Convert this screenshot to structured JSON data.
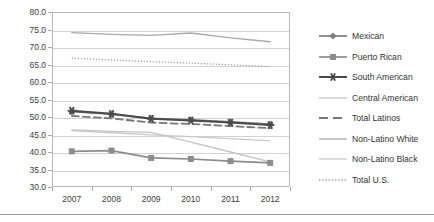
{
  "chart_data": {
    "type": "line",
    "title": "",
    "subtitle": "",
    "xlabel": "",
    "ylabel": "",
    "categories": [
      "2007",
      "2008",
      "2009",
      "2010",
      "2011",
      "2012"
    ],
    "x": [
      2007,
      2008,
      2009,
      2010,
      2011,
      2012
    ],
    "ylim": [
      30.0,
      80.0
    ],
    "ytick_step": 5.0,
    "ytick_labels": [
      "80.0",
      "75.0",
      "70.0",
      "65.0",
      "60.0",
      "55.0",
      "50.0",
      "45.0",
      "40.0",
      "35.0",
      "30.0"
    ],
    "ytick_values": [
      80.0,
      75.0,
      70.0,
      65.0,
      60.0,
      55.0,
      50.0,
      45.0,
      40.0,
      35.0,
      30.0
    ],
    "xtick_labels": [
      "2007",
      "2008",
      "2009",
      "2010",
      "2011",
      "2012"
    ],
    "grid": "horizontal",
    "legend_position": "right",
    "series": [
      {
        "name": "Mexican",
        "marker": "diamond",
        "linestyle": "solid",
        "color": "#808080",
        "values": [
          51.5,
          50.8,
          49.6,
          49.2,
          48.6,
          48.0
        ]
      },
      {
        "name": "Puerto Rican",
        "marker": "square",
        "linestyle": "solid",
        "color": "#8c8c8c",
        "values": [
          40.2,
          40.4,
          38.3,
          38.0,
          37.4,
          36.9
        ]
      },
      {
        "name": "South American",
        "marker": "star",
        "linestyle": "solid",
        "color": "#4a4a4a",
        "values": [
          51.8,
          50.9,
          49.5,
          49.0,
          48.4,
          47.7
        ]
      },
      {
        "name": "Central American",
        "marker": "none",
        "linestyle": "solid",
        "color": "#c4c4c4",
        "values": [
          46.3,
          45.9,
          45.6,
          42.8,
          40.0,
          37.2
        ]
      },
      {
        "name": "Total Latinos",
        "marker": "none",
        "linestyle": "dashed",
        "color": "#777777",
        "values": [
          50.3,
          49.6,
          48.4,
          48.0,
          47.4,
          46.8
        ]
      },
      {
        "name": "Non-Latino White",
        "marker": "none",
        "linestyle": "solid",
        "color": "#a9a9a9",
        "values": [
          74.1,
          73.6,
          73.3,
          74.0,
          72.6,
          71.5
        ]
      },
      {
        "name": "Non-Latino Black",
        "marker": "none",
        "linestyle": "solid",
        "color": "#c9c9c9",
        "values": [
          46.1,
          45.5,
          44.9,
          44.4,
          43.8,
          43.2
        ]
      },
      {
        "name": "Total U.S.",
        "marker": "none",
        "linestyle": "dotted",
        "color": "#9e9e9e",
        "values": [
          66.8,
          66.3,
          65.8,
          65.4,
          64.9,
          64.4
        ]
      }
    ]
  },
  "legend": {
    "items": [
      {
        "label": "Mexican"
      },
      {
        "label": "Puerto Rican"
      },
      {
        "label": "South American"
      },
      {
        "label": "Central American"
      },
      {
        "label": "Total Latinos"
      },
      {
        "label": "Non-Latino White"
      },
      {
        "label": "Non-Latino Black"
      },
      {
        "label": "Total U.S."
      }
    ]
  },
  "colors": {
    "plot_border": "#b9b9b9",
    "gridline": "#d2d2d2",
    "axis_text": "#3d3d3d",
    "background": "#ffffff"
  }
}
